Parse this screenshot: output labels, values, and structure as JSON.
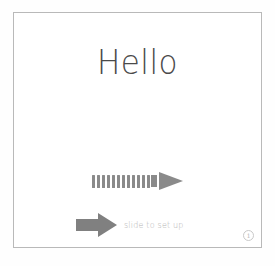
{
  "screen": {
    "background_color": "#fefefe",
    "frame": {
      "border_color": "#b9b9b9",
      "background_color": "#ffffff"
    }
  },
  "greeting": {
    "text": "Hello",
    "color": "#4a4a4a"
  },
  "slide_gesture": {
    "icon_name": "striped-arrow-right-icon",
    "stripe_count": 12,
    "color": "#8a8a8a"
  },
  "slide_control": {
    "knob_icon_name": "block-arrow-right-icon",
    "label": "slide to set up",
    "knob_color": "#808080",
    "label_color": "#b4b4b4"
  },
  "info_button": {
    "label": "i",
    "icon_name": "info-circle-icon",
    "color": "#c4c4c4"
  }
}
